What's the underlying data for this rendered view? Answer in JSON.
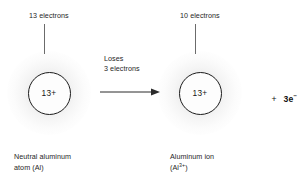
{
  "figure": {
    "type": "chemistry-diagram",
    "background_color": "#ffffff",
    "text_color": "#262626",
    "line_color": "#6b6b6b"
  },
  "left": {
    "electron_label": "13 electrons",
    "nucleus_charge": "13+",
    "caption_line1": "Neutral aluminum",
    "caption_line2": "atom (Al)"
  },
  "middle": {
    "process_line1": "Loses",
    "process_line2": "3 electrons",
    "arrow_direction": "right"
  },
  "right": {
    "electron_label": "10 electrons",
    "nucleus_charge": "13+",
    "caption_line1": "Aluminum ion",
    "caption_line2_prefix": "(Al",
    "caption_line2_superscript": "3+",
    "caption_line2_suffix": ")"
  },
  "product": {
    "plus_sign": "+",
    "coefficient_species": "3e",
    "charge_superscript": "−"
  }
}
